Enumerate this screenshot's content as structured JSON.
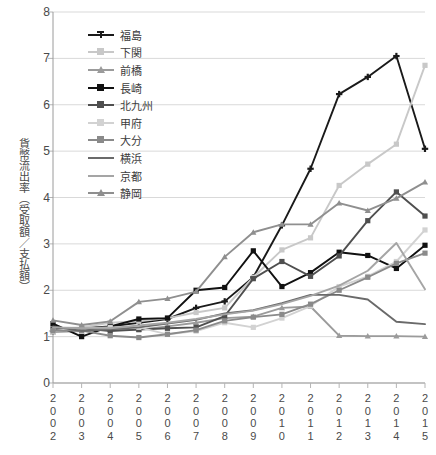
{
  "chart_data": {
    "type": "line",
    "title": "",
    "xlabel": "",
    "ylabel": "貨幣流出率（受取額／支払額）",
    "categories": [
      "2002",
      "2003",
      "2004",
      "2005",
      "2006",
      "2007",
      "2008",
      "2009",
      "2010",
      "2011",
      "2012",
      "2013",
      "2014",
      "2015"
    ],
    "ylim": [
      0,
      8
    ],
    "yticks": [
      0,
      1,
      2,
      3,
      4,
      5,
      6,
      7,
      8
    ],
    "grid": true,
    "legend_position": "upper-left-inside",
    "series": [
      {
        "name": "福島",
        "color": "#1a1a1a",
        "marker": "cross",
        "values": [
          1.12,
          1.18,
          1.22,
          1.3,
          1.38,
          1.62,
          1.76,
          2.28,
          3.4,
          4.62,
          6.23,
          6.6,
          7.05,
          5.05
        ]
      },
      {
        "name": "下関",
        "color": "#c8c8c8",
        "marker": "square",
        "values": [
          1.18,
          1.2,
          1.3,
          1.33,
          1.4,
          1.52,
          1.62,
          2.28,
          2.87,
          3.13,
          4.26,
          4.72,
          5.15,
          6.85
        ]
      },
      {
        "name": "前橋",
        "color": "#9b9b9b",
        "marker": "triangle",
        "values": [
          1.1,
          1.12,
          1.15,
          1.15,
          1.22,
          1.3,
          1.4,
          1.43,
          1.62,
          1.65,
          1.02,
          1.01,
          1.01,
          1.0
        ]
      },
      {
        "name": "長崎",
        "color": "#111111",
        "marker": "square",
        "values": [
          1.28,
          1.0,
          1.22,
          1.38,
          1.4,
          2.0,
          2.06,
          2.85,
          2.08,
          2.38,
          2.82,
          2.75,
          2.47,
          2.97
        ]
      },
      {
        "name": "北九州",
        "color": "#4f4f4f",
        "marker": "square",
        "values": [
          1.16,
          1.18,
          1.12,
          1.15,
          1.18,
          1.2,
          1.44,
          2.25,
          2.62,
          2.3,
          2.74,
          3.5,
          4.12,
          3.6
        ]
      },
      {
        "name": "甲府",
        "color": "#d2d2d2",
        "marker": "square",
        "values": [
          1.12,
          1.18,
          1.2,
          1.2,
          1.05,
          1.12,
          1.3,
          1.2,
          1.4,
          1.66,
          2.08,
          2.3,
          2.62,
          3.3
        ]
      },
      {
        "name": "大分",
        "color": "#8a8a8a",
        "marker": "square",
        "values": [
          1.13,
          1.13,
          1.02,
          0.98,
          1.05,
          1.14,
          1.34,
          1.42,
          1.48,
          1.7,
          2.0,
          2.28,
          2.58,
          2.8
        ]
      },
      {
        "name": "横浜",
        "color": "#6a6a6a",
        "marker": "line",
        "values": [
          1.22,
          1.12,
          1.16,
          1.2,
          1.28,
          1.36,
          1.5,
          1.57,
          1.72,
          1.9,
          1.9,
          1.8,
          1.32,
          1.27
        ]
      },
      {
        "name": "京都",
        "color": "#a5a5a5",
        "marker": "line",
        "values": [
          1.2,
          1.18,
          1.18,
          1.24,
          1.3,
          1.38,
          1.48,
          1.56,
          1.7,
          1.88,
          2.1,
          2.42,
          3.02,
          2.02
        ]
      },
      {
        "name": "静岡",
        "color": "#8f8f8f",
        "marker": "triangle",
        "values": [
          1.35,
          1.25,
          1.33,
          1.75,
          1.82,
          1.97,
          2.72,
          3.25,
          3.42,
          3.42,
          3.88,
          3.72,
          3.98,
          4.33
        ]
      }
    ]
  }
}
